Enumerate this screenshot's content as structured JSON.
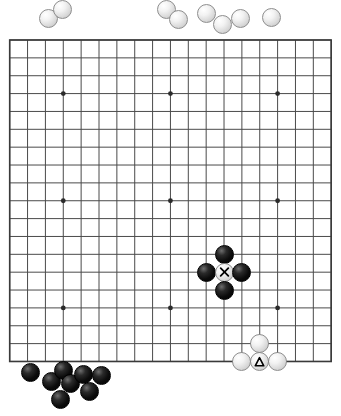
{
  "app": {
    "title": "Go Board Position",
    "board_size": 19,
    "colors": {
      "background": "#ffffff",
      "grid_line": "#4a4a4a",
      "board_edge": "#3a3a3a",
      "star_point": "#2b2b2b",
      "black_stone": "#000000",
      "white_stone": "#f2f2f2",
      "white_stone_outline": "#8e8e8e",
      "marker": "#000000"
    }
  },
  "board": {
    "label": "19x19 go board grid",
    "origin_x": 9.7,
    "origin_y": 40.0,
    "spacing": 17.86,
    "lines": 19,
    "star_points": [
      {
        "col": 3,
        "row": 3
      },
      {
        "col": 9,
        "row": 3
      },
      {
        "col": 15,
        "row": 3
      },
      {
        "col": 3,
        "row": 9
      },
      {
        "col": 9,
        "row": 9
      },
      {
        "col": 15,
        "row": 9
      },
      {
        "col": 3,
        "row": 15
      },
      {
        "col": 9,
        "row": 15
      },
      {
        "col": 15,
        "row": 15
      }
    ],
    "stone_radius": 9.5
  },
  "board_stones": [
    {
      "color": "black",
      "col": 12,
      "row": 12,
      "marker": "none",
      "name": "black-stone-above-marked"
    },
    {
      "color": "black",
      "col": 11,
      "row": 13,
      "marker": "none",
      "name": "black-stone-left-of-marked"
    },
    {
      "color": "white",
      "col": 12,
      "row": 13,
      "marker": "cross",
      "name": "white-stone-marked-x"
    },
    {
      "color": "black",
      "col": 13,
      "row": 13,
      "marker": "none",
      "name": "black-stone-right-of-marked"
    },
    {
      "color": "black",
      "col": 12,
      "row": 14,
      "marker": "none",
      "name": "black-stone-below-marked"
    },
    {
      "color": "white",
      "col": 14,
      "row": 17,
      "marker": "none",
      "name": "white-stone-bottom-upper"
    },
    {
      "color": "white",
      "col": 13,
      "row": 18,
      "marker": "none",
      "name": "white-stone-bottom-left"
    },
    {
      "color": "white",
      "col": 14,
      "row": 18,
      "marker": "triangle",
      "name": "white-stone-marked-triangle"
    },
    {
      "color": "white",
      "col": 15,
      "row": 18,
      "marker": "none",
      "name": "white-stone-bottom-right"
    }
  ],
  "captured_white": {
    "label": "white stones captured",
    "count": 9,
    "stones": [
      {
        "x": 48,
        "y": 18,
        "r": 9.5,
        "name": "captured-white-stone-1"
      },
      {
        "x": 62,
        "y": 9,
        "r": 9.5,
        "name": "captured-white-stone-2"
      },
      {
        "x": 166,
        "y": 9,
        "r": 9.5,
        "name": "captured-white-stone-3"
      },
      {
        "x": 178,
        "y": 19,
        "r": 9.5,
        "name": "captured-white-stone-4"
      },
      {
        "x": 206,
        "y": 13,
        "r": 9.5,
        "name": "captured-white-stone-5"
      },
      {
        "x": 222,
        "y": 24,
        "r": 9.5,
        "name": "captured-white-stone-6"
      },
      {
        "x": 240,
        "y": 18,
        "r": 9.5,
        "name": "captured-white-stone-7"
      },
      {
        "x": 271,
        "y": 17,
        "r": 9.5,
        "name": "captured-white-stone-8"
      },
      {
        "x": 232,
        "y": 26,
        "r": 0.0,
        "name": "captured-white-stone-9"
      }
    ]
  },
  "captured_black": {
    "label": "black stones captured",
    "count": 8,
    "stones": [
      {
        "x": 30,
        "y": 372,
        "r": 9.5,
        "name": "captured-black-stone-1"
      },
      {
        "x": 51,
        "y": 381,
        "r": 9.5,
        "name": "captured-black-stone-2"
      },
      {
        "x": 63,
        "y": 370,
        "r": 9.5,
        "name": "captured-black-stone-3"
      },
      {
        "x": 70,
        "y": 383,
        "r": 9.5,
        "name": "captured-black-stone-4"
      },
      {
        "x": 60,
        "y": 399,
        "r": 9.5,
        "name": "captured-black-stone-5"
      },
      {
        "x": 83,
        "y": 374,
        "r": 9.5,
        "name": "captured-black-stone-6"
      },
      {
        "x": 101,
        "y": 375,
        "r": 9.5,
        "name": "captured-black-stone-7"
      },
      {
        "x": 89,
        "y": 391,
        "r": 9.5,
        "name": "captured-black-stone-8"
      }
    ]
  },
  "markers": {
    "cross": "x-mark",
    "triangle": "triangle-mark"
  }
}
